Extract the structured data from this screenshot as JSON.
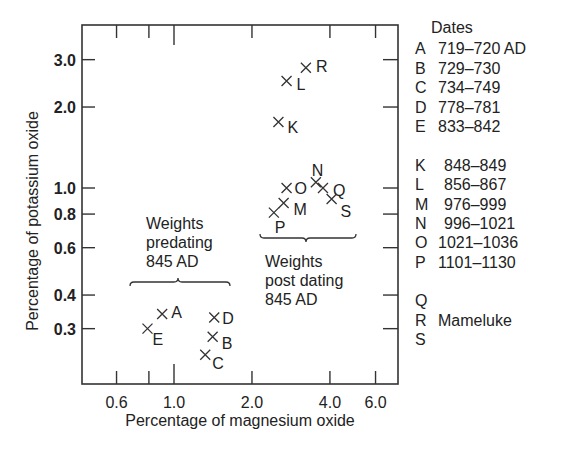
{
  "chart_data": {
    "type": "scatter",
    "title": "",
    "xlabel": "Percentage of magnesium oxide",
    "ylabel": "Percentage of potassium oxide",
    "xscale": "log",
    "yscale": "log",
    "xlim": [
      0.5,
      7.0
    ],
    "ylim": [
      0.22,
      3.6
    ],
    "xticks": [
      0.6,
      0.8,
      1.0,
      2.0,
      4.0,
      6.0
    ],
    "xtick_labels": [
      "0.6",
      "",
      "1.0",
      "2.0",
      "4.0",
      "6.0"
    ],
    "yticks": [
      0.3,
      0.4,
      0.6,
      0.8,
      1.0,
      2.0,
      3.0
    ],
    "ytick_labels": [
      "0.3",
      "0.4",
      "0.6",
      "0.8",
      "1.0",
      "2.0",
      "3.0"
    ],
    "grid": false,
    "marker": "x",
    "points": [
      {
        "label": "A",
        "x": 0.9,
        "y": 0.34,
        "group": "predating"
      },
      {
        "label": "B",
        "x": 1.41,
        "y": 0.28,
        "group": "predating"
      },
      {
        "label": "C",
        "x": 1.32,
        "y": 0.24,
        "group": "predating"
      },
      {
        "label": "D",
        "x": 1.43,
        "y": 0.33,
        "group": "predating"
      },
      {
        "label": "E",
        "x": 0.79,
        "y": 0.3,
        "group": "predating"
      },
      {
        "label": "K",
        "x": 2.53,
        "y": 1.76,
        "group": "postdating"
      },
      {
        "label": "L",
        "x": 2.72,
        "y": 2.5,
        "group": "postdating"
      },
      {
        "label": "M",
        "x": 2.65,
        "y": 0.88,
        "group": "postdating"
      },
      {
        "label": "N",
        "x": 3.53,
        "y": 1.05,
        "group": "postdating"
      },
      {
        "label": "O",
        "x": 2.72,
        "y": 1.0,
        "group": "postdating"
      },
      {
        "label": "P",
        "x": 2.43,
        "y": 0.81,
        "group": "postdating"
      },
      {
        "label": "Q",
        "x": 3.76,
        "y": 1.0,
        "group": "mameluke"
      },
      {
        "label": "R",
        "x": 3.23,
        "y": 2.8,
        "group": "mameluke"
      },
      {
        "label": "S",
        "x": 4.06,
        "y": 0.91,
        "group": "mameluke"
      }
    ],
    "annotations": [
      {
        "text": [
          "Weights",
          "predating",
          "845 AD"
        ],
        "brace_over": [
          "A",
          "B",
          "C",
          "D",
          "E"
        ]
      },
      {
        "text": [
          "Weights",
          "post dating",
          "845 AD"
        ],
        "brace_under": [
          "K",
          "L",
          "M",
          "N",
          "O",
          "P",
          "Q",
          "R",
          "S"
        ]
      }
    ],
    "legend": {
      "title": "Dates",
      "position": "right",
      "entries": [
        {
          "key": "A",
          "value": "719–720 AD"
        },
        {
          "key": "B",
          "value": "729–730"
        },
        {
          "key": "C",
          "value": "734–749"
        },
        {
          "key": "D",
          "value": "778–781"
        },
        {
          "key": "E",
          "value": "833–842"
        },
        {
          "key": "K",
          "value": "848–849"
        },
        {
          "key": "L",
          "value": "856–867"
        },
        {
          "key": "M",
          "value": "976–999"
        },
        {
          "key": "N",
          "value": "996–1021"
        },
        {
          "key": "O",
          "value": "1021–1036"
        },
        {
          "key": "P",
          "value": "1101–1130"
        },
        {
          "key": "Q",
          "value": ""
        },
        {
          "key": "R",
          "value": "Mameluke"
        },
        {
          "key": "S",
          "value": ""
        }
      ]
    }
  },
  "annotation_pre": {
    "line1": "Weights",
    "line2": "predating",
    "line3": "845 AD"
  },
  "annotation_post": {
    "line1": "Weights",
    "line2": "post dating",
    "line3": "845 AD"
  },
  "legend_view": {
    "title": "Dates",
    "group1": [
      {
        "key": "A",
        "value": "719–720 AD"
      },
      {
        "key": "B",
        "value": "729–730"
      },
      {
        "key": "C",
        "value": "734–749"
      },
      {
        "key": "D",
        "value": "778–781"
      },
      {
        "key": "E",
        "value": "833–842"
      }
    ],
    "group2": [
      {
        "key": "K",
        "value": "848–849"
      },
      {
        "key": "L",
        "value": "856–867"
      },
      {
        "key": "M",
        "value": "976–999"
      },
      {
        "key": "N",
        "value": "996–1021"
      },
      {
        "key": "O",
        "value": "1021–1036"
      },
      {
        "key": "P",
        "value": "1101–1130"
      }
    ],
    "group3": [
      {
        "key": "Q",
        "value": ""
      },
      {
        "key": "R",
        "value": "Mameluke"
      },
      {
        "key": "S",
        "value": ""
      }
    ]
  }
}
